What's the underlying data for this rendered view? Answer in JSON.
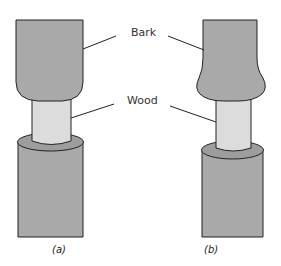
{
  "labels": {
    "bark": "Bark",
    "wood": "Wood"
  },
  "captions": {
    "a": "(a)",
    "b": "(b)"
  },
  "colors": {
    "bark_fill": "#a9a9a9",
    "bark_dark": "#949494",
    "wood_fill": "#dcdcdc",
    "outline": "#222222",
    "background": "#ffffff"
  },
  "panels": [
    {
      "id": "a",
      "description": "Tree stem with girdled ring of bark removed; upper bark uniform width"
    },
    {
      "id": "b",
      "description": "Tree stem with girdled ring of bark removed; upper bark swollen above girdle"
    }
  ]
}
